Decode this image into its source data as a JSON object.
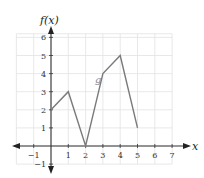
{
  "chart_data": {
    "type": "line",
    "title": "",
    "xlabel": "x",
    "ylabel": "f(x)",
    "xlim": [
      -2,
      7
    ],
    "ylim": [
      -1,
      6.2
    ],
    "x_ticks": [
      -1,
      1,
      2,
      3,
      4,
      5,
      6,
      7
    ],
    "y_ticks": [
      -1,
      1,
      2,
      3,
      4,
      5,
      6
    ],
    "grid": true,
    "series": [
      {
        "name": "g",
        "x": [
          0,
          1,
          2,
          3,
          4,
          5
        ],
        "values": [
          2,
          3,
          0,
          4,
          5,
          1
        ],
        "color": "#7a7a7a"
      }
    ],
    "annotations": [
      {
        "text": "g",
        "x": 2.55,
        "y": 3.5
      }
    ]
  },
  "labels": {
    "y_axis_title": "f(x)",
    "x_axis_title": "x",
    "series_label": "g"
  }
}
